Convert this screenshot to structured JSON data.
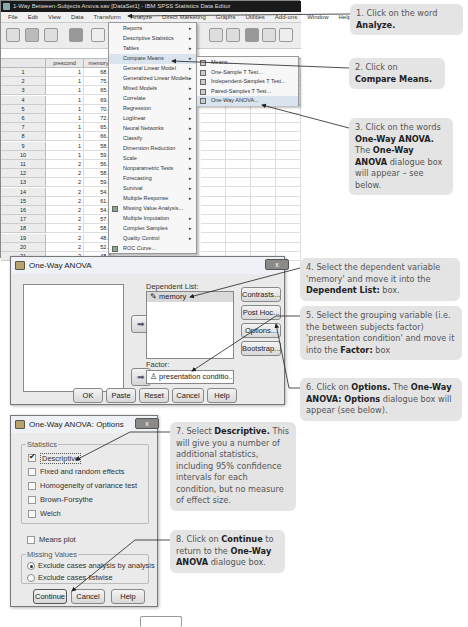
{
  "spss_window": {
    "title": "1-Way Between-Subjects Anova.sav [DataSet1] - IBM SPSS Statistics Data Editor",
    "menus": [
      "File",
      "Edit",
      "View",
      "Data",
      "Transform",
      "Analyze",
      "Direct Marketing",
      "Graphs",
      "Utilities",
      "Add-ons",
      "Window",
      "Help"
    ],
    "toolbar_icons": [
      "open-icon",
      "save-icon",
      "print-icon",
      "dialog-recall-icon",
      "undo-icon",
      "goto-case-icon",
      "goto-variable-icon",
      "variables-icon",
      "split-file-icon",
      "weight-icon",
      "value-labels-icon",
      "use-sets-icon",
      "spell-icon"
    ],
    "columns": [
      "prescond",
      "memory",
      "var"
    ],
    "rows": [
      {
        "n": "1",
        "prescond": "1",
        "memory": "68.0"
      },
      {
        "n": "2",
        "prescond": "1",
        "memory": "75.0"
      },
      {
        "n": "3",
        "prescond": "1",
        "memory": "65.0"
      },
      {
        "n": "4",
        "prescond": "1",
        "memory": "69.0"
      },
      {
        "n": "5",
        "prescond": "1",
        "memory": "70.0"
      },
      {
        "n": "6",
        "prescond": "1",
        "memory": "72.0"
      },
      {
        "n": "7",
        "prescond": "1",
        "memory": "65.0"
      },
      {
        "n": "8",
        "prescond": "1",
        "memory": "66.0"
      },
      {
        "n": "9",
        "prescond": "1",
        "memory": "58.0"
      },
      {
        "n": "10",
        "prescond": "1",
        "memory": "59.0"
      },
      {
        "n": "11",
        "prescond": "2",
        "memory": "56.0"
      },
      {
        "n": "12",
        "prescond": "2",
        "memory": "58.0"
      },
      {
        "n": "13",
        "prescond": "2",
        "memory": "59.0"
      },
      {
        "n": "14",
        "prescond": "2",
        "memory": "54.0"
      },
      {
        "n": "15",
        "prescond": "2",
        "memory": "61.0"
      },
      {
        "n": "16",
        "prescond": "2",
        "memory": "54.0"
      },
      {
        "n": "17",
        "prescond": "2",
        "memory": "57.0"
      },
      {
        "n": "18",
        "prescond": "2",
        "memory": "58.0"
      },
      {
        "n": "19",
        "prescond": "2",
        "memory": "48.0"
      },
      {
        "n": "20",
        "prescond": "2",
        "memory": "52.0"
      },
      {
        "n": "21",
        "prescond": "2",
        "memory": "48.0"
      }
    ]
  },
  "analyze_menu": {
    "items": [
      {
        "label": "Reports",
        "submenu": true
      },
      {
        "label": "Descriptive Statistics",
        "submenu": true
      },
      {
        "label": "Tables",
        "submenu": true
      },
      {
        "label": "Compare Means",
        "submenu": true,
        "highlighted": true
      },
      {
        "label": "General Linear Model",
        "submenu": true
      },
      {
        "label": "Generalized Linear Models",
        "submenu": true
      },
      {
        "label": "Mixed Models",
        "submenu": true
      },
      {
        "label": "Correlate",
        "submenu": true
      },
      {
        "label": "Regression",
        "submenu": true
      },
      {
        "label": "Loglinear",
        "submenu": true
      },
      {
        "label": "Neural Networks",
        "submenu": true
      },
      {
        "label": "Classify",
        "submenu": true
      },
      {
        "label": "Dimension Reduction",
        "submenu": true
      },
      {
        "label": "Scale",
        "submenu": true
      },
      {
        "label": "Nonparametric Tests",
        "submenu": true
      },
      {
        "label": "Forecasting",
        "submenu": true
      },
      {
        "label": "Survival",
        "submenu": true
      },
      {
        "label": "Multiple Response",
        "submenu": true
      },
      {
        "label": "Missing Value Analysis...",
        "submenu": false,
        "icon": true
      },
      {
        "label": "Multiple Imputation",
        "submenu": true
      },
      {
        "label": "Complex Samples",
        "submenu": true
      },
      {
        "label": "Quality Control",
        "submenu": true
      },
      {
        "label": "ROC Curve...",
        "submenu": false,
        "icon": true
      }
    ]
  },
  "compare_means_submenu": {
    "items": [
      {
        "label": "Means..."
      },
      {
        "label": "One-Sample T Test..."
      },
      {
        "label": "Independent-Samples T Test..."
      },
      {
        "label": "Paired-Samples T Test..."
      },
      {
        "label": "One-Way ANOVA...",
        "highlighted": true
      }
    ]
  },
  "oneway_dialog": {
    "title": "One-Way ANOVA",
    "close_label": "x",
    "dependent_list_label": "Dependent List:",
    "dependent_item": "memory",
    "factor_label": "Factor:",
    "factor_item": "presentation conditio...",
    "side_buttons": [
      "Contrasts...",
      "Post Hoc...",
      "Options...",
      "Bootstrap..."
    ],
    "bottom_buttons": [
      "OK",
      "Paste",
      "Reset",
      "Cancel",
      "Help"
    ]
  },
  "options_dialog": {
    "title": "One-Way ANOVA: Options",
    "statistics_label": "Statistics",
    "statistics": [
      {
        "label": "Descriptive",
        "checked": true
      },
      {
        "label": "Fixed and random effects",
        "checked": false
      },
      {
        "label": "Homogeneity of variance test",
        "checked": false
      },
      {
        "label": "Brown-Forsythe",
        "checked": false
      },
      {
        "label": "Welch",
        "checked": false
      }
    ],
    "means_plot_label": "Means plot",
    "missing_values_label": "Missing Values",
    "missing_options": [
      {
        "label": "Exclude cases analysis by analysis",
        "selected": true
      },
      {
        "label": "Exclude cases listwise",
        "selected": false
      }
    ],
    "buttons": [
      "Continue",
      "Cancel",
      "Help"
    ]
  },
  "callouts": {
    "c1": {
      "pre": "1. Click on the word ",
      "bold": "Analyze."
    },
    "c2": {
      "pre": "2. Click on ",
      "bold": "Compare Means."
    },
    "c3": {
      "pre": "3. Click on the words ",
      "bold1": "One-Way ANOVA.",
      "mid": " The ",
      "bold2": "One-Way ANOVA",
      "post": " dialogue box will appear – see below."
    },
    "c4": {
      "pre": "4. Select the dependent variable 'memory' and move it into the ",
      "bold": "Dependent List:",
      "post": " box."
    },
    "c5": {
      "pre": "5. Select the grouping variable (i.e. the between subjects factor) 'presentation condition' and move it into the ",
      "bold": "Factor:",
      "post": " box"
    },
    "c6": {
      "pre": "6. Click on ",
      "bold1": "Options.",
      "mid": " The ",
      "bold2": "One-Way ANOVA: Options",
      "post": " dialogue box will appear (see below)."
    },
    "c7": {
      "pre": "7. Select ",
      "bold": "Descriptive.",
      "post": " This will give you a number of additional statistics, including 95% confidence intervals for each condition, but no measure of effect size."
    },
    "c8": {
      "pre": "8. Click on ",
      "bold1": "Continue",
      "mid": " to return to the ",
      "bold2": "One-Way ANOVA",
      "post": " dialogue box."
    }
  }
}
